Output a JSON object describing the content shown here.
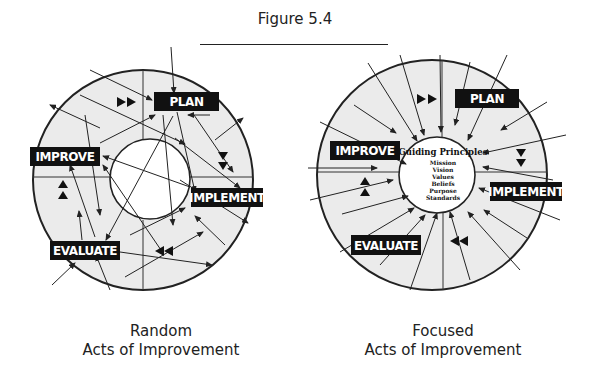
{
  "figure": {
    "title": "Figure 5.4"
  },
  "diagrams": [
    {
      "id": "random",
      "caption_line1": "Random",
      "caption_line2": "Acts of Improvement",
      "stages": [
        "PLAN",
        "IMPLEMENT",
        "EVALUATE",
        "IMPROVE"
      ],
      "center_text": null
    },
    {
      "id": "focused",
      "caption_line1": "Focused",
      "caption_line2": "Acts of Improvement",
      "stages": [
        "PLAN",
        "IMPLEMENT",
        "EVALUATE",
        "IMPROVE"
      ],
      "center_text": {
        "heading": "Guiding Principles",
        "items": [
          "Mission",
          "Vision",
          "Values",
          "Beliefs",
          "Purpose",
          "Standards"
        ]
      }
    }
  ],
  "colors": {
    "ring_fill": "#ebebeb",
    "label_bg": "#111111",
    "label_text": "#ffffff",
    "line": "#222222"
  }
}
